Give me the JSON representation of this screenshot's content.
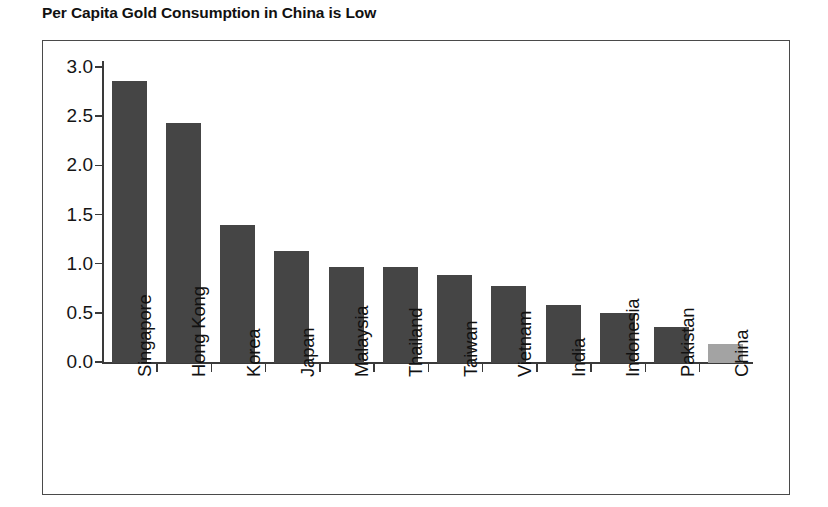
{
  "chart_data": {
    "type": "bar",
    "title": "Per Capita Gold Consumption in China is Low",
    "xlabel": "",
    "ylabel": "",
    "ylim": [
      0.0,
      3.0
    ],
    "yticks": [
      "0.0",
      "0.5",
      "1.0",
      "1.5",
      "2.0",
      "2.5",
      "3.0"
    ],
    "ytick_values": [
      0.0,
      0.5,
      1.0,
      1.5,
      2.0,
      2.5,
      3.0
    ],
    "grid": false,
    "legend": "none",
    "categories": [
      "Singapore",
      "Hong Kong",
      "Korea",
      "Japan",
      "Malaysia",
      "Thailand",
      "Taiwan",
      "Vietnam",
      "India",
      "Indonesia",
      "Pakistan",
      "China"
    ],
    "values": [
      2.87,
      2.44,
      1.4,
      1.14,
      0.98,
      0.98,
      0.9,
      0.78,
      0.59,
      0.51,
      0.37,
      0.19
    ],
    "bar_colors": [
      "#454545",
      "#454545",
      "#454545",
      "#454545",
      "#454545",
      "#454545",
      "#454545",
      "#454545",
      "#454545",
      "#454545",
      "#454545",
      "#a3a3a3"
    ],
    "highlight_category": "China",
    "highlight_color": "#a3a3a3",
    "series_color": "#454545",
    "axis_color": "#3a3a3a",
    "frame_color": "#4a4a4a",
    "background": "#ffffff"
  }
}
